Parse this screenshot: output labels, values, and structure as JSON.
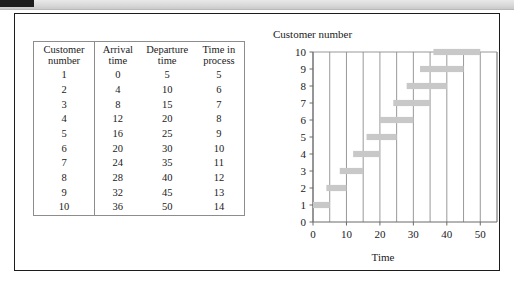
{
  "figure": {
    "table": {
      "headers": [
        "Customer\nnumber",
        "Arrival\ntime",
        "Departure\ntime",
        "Time in\nprocess"
      ],
      "rows": [
        [
          "1",
          "0",
          "5",
          "5"
        ],
        [
          "2",
          "4",
          "10",
          "6"
        ],
        [
          "3",
          "8",
          "15",
          "7"
        ],
        [
          "4",
          "12",
          "20",
          "8"
        ],
        [
          "5",
          "16",
          "25",
          "9"
        ],
        [
          "6",
          "20",
          "30",
          "10"
        ],
        [
          "7",
          "24",
          "35",
          "11"
        ],
        [
          "8",
          "28",
          "40",
          "12"
        ],
        [
          "9",
          "32",
          "45",
          "13"
        ],
        [
          "10",
          "36",
          "50",
          "14"
        ]
      ]
    }
  },
  "chart_data": {
    "type": "bar",
    "orientation": "horizontal",
    "title": "Customer number",
    "xlabel": "Time",
    "ylabel": "Customer number",
    "xlim": [
      0,
      55
    ],
    "ylim": [
      0,
      10
    ],
    "xticks": [
      0,
      10,
      20,
      30,
      40,
      50
    ],
    "xtick_labels": [
      "0",
      "10",
      "20",
      "30",
      "40",
      "50"
    ],
    "yticks": [
      0,
      1,
      2,
      3,
      4,
      5,
      6,
      7,
      8,
      9,
      10
    ],
    "ytick_labels": [
      "0",
      "1",
      "2",
      "3",
      "4",
      "5",
      "6",
      "7",
      "8",
      "9",
      "10"
    ],
    "gridlines": {
      "vertical_every": 5,
      "horizontal": false
    },
    "grid_color": "#8d8d8d",
    "bar_color": "#c8c8c8",
    "categories": [
      "1",
      "2",
      "3",
      "4",
      "5",
      "6",
      "7",
      "8",
      "9",
      "10"
    ],
    "bars": [
      {
        "customer": 1,
        "start": 0,
        "end": 5,
        "duration": 5
      },
      {
        "customer": 2,
        "start": 4,
        "end": 10,
        "duration": 6
      },
      {
        "customer": 3,
        "start": 8,
        "end": 15,
        "duration": 7
      },
      {
        "customer": 4,
        "start": 12,
        "end": 20,
        "duration": 8
      },
      {
        "customer": 5,
        "start": 16,
        "end": 25,
        "duration": 9
      },
      {
        "customer": 6,
        "start": 20,
        "end": 30,
        "duration": 10
      },
      {
        "customer": 7,
        "start": 24,
        "end": 35,
        "duration": 11
      },
      {
        "customer": 8,
        "start": 28,
        "end": 40,
        "duration": 12
      },
      {
        "customer": 9,
        "start": 32,
        "end": 45,
        "duration": 13
      },
      {
        "customer": 10,
        "start": 36,
        "end": 50,
        "duration": 14
      }
    ]
  }
}
